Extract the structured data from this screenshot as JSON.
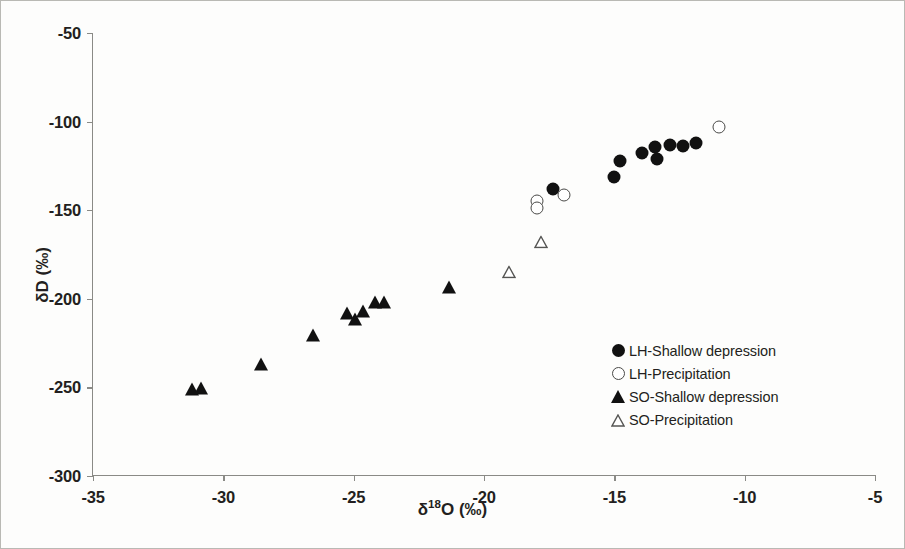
{
  "chart_data": {
    "type": "scatter",
    "title": "",
    "xlabel": "δ¹⁸O (‰)",
    "ylabel": "δD (‰)",
    "xlim": [
      -35,
      -5
    ],
    "ylim": [
      -300,
      -50
    ],
    "xticks": [
      -35,
      -30,
      -25,
      -20,
      -15,
      -10,
      -5
    ],
    "xtick_labels": [
      "-35",
      "-30",
      "-25",
      "-20",
      "-15",
      "-10",
      "-5"
    ],
    "yticks": [
      -50,
      -100,
      -150,
      -200,
      -250,
      -300
    ],
    "ytick_labels": [
      "-50",
      "-100",
      "-150",
      "-200",
      "-250",
      "-300"
    ],
    "grid": false,
    "legend_position": "lower right",
    "series": [
      {
        "name": "LH-Shallow depression",
        "marker": "filled-circle",
        "color": "#111111",
        "points": [
          [
            -17.35,
            -138.0
          ],
          [
            -15.0,
            -131.0
          ],
          [
            -14.8,
            -122.5
          ],
          [
            -13.95,
            -117.5
          ],
          [
            -13.45,
            -114.5
          ],
          [
            -13.35,
            -121.0
          ],
          [
            -12.85,
            -113.0
          ],
          [
            -12.35,
            -113.5
          ],
          [
            -11.85,
            -112.0
          ]
        ]
      },
      {
        "name": "LH-Precipitation",
        "marker": "open-circle",
        "color": "#4a4a48",
        "points": [
          [
            -17.95,
            -145.0
          ],
          [
            -17.95,
            -148.5
          ],
          [
            -16.95,
            -141.5
          ],
          [
            -11.0,
            -103.0
          ]
        ]
      },
      {
        "name": "SO-Shallow depression",
        "marker": "filled-triangle",
        "color": "#111111",
        "points": [
          [
            -31.2,
            -251.0
          ],
          [
            -30.85,
            -250.5
          ],
          [
            -28.55,
            -237.0
          ],
          [
            -26.55,
            -220.5
          ],
          [
            -25.25,
            -208.0
          ],
          [
            -24.95,
            -211.5
          ],
          [
            -24.65,
            -207.0
          ],
          [
            -24.2,
            -202.0
          ],
          [
            -23.85,
            -202.0
          ],
          [
            -21.35,
            -193.5
          ]
        ]
      },
      {
        "name": "SO-Precipitation",
        "marker": "open-triangle",
        "color": "#555553",
        "points": [
          [
            -17.8,
            -167.5
          ],
          [
            -19.05,
            -184.5
          ]
        ]
      }
    ]
  },
  "legend": {
    "items": [
      {
        "marker": "filled-circle",
        "label": "LH-Shallow depression"
      },
      {
        "marker": "open-circle",
        "label": "LH-Precipitation"
      },
      {
        "marker": "filled-triangle",
        "label": "SO-Shallow depression"
      },
      {
        "marker": "open-triangle",
        "label": "SO-Precipitation"
      }
    ]
  }
}
